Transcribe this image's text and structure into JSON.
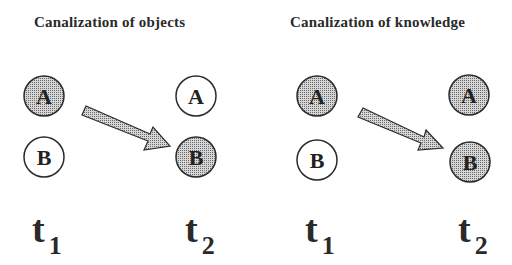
{
  "panels": [
    {
      "title": "Canalization of objects",
      "t1": {
        "label": "A",
        "filled": true,
        "second": "B",
        "second_filled": false
      },
      "t2": {
        "label": "A",
        "filled": false,
        "second": "B",
        "second_filled": true
      },
      "time_labels": {
        "t1": "t",
        "t1_sub": "1",
        "t2": "t",
        "t2_sub": "2"
      }
    },
    {
      "title": "Canalization of knowledge",
      "t1": {
        "label": "A",
        "filled": true,
        "second": "B",
        "second_filled": false
      },
      "t2": {
        "label": "A",
        "filled": true,
        "second": "B",
        "second_filled": true
      },
      "time_labels": {
        "t1": "t",
        "t1_sub": "1",
        "t2": "t",
        "t2_sub": "2"
      }
    }
  ],
  "colors": {
    "fill": "#b8b8b8",
    "stroke": "#2a2a2a",
    "background": "#ffffff"
  }
}
